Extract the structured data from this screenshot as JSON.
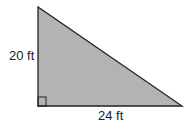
{
  "diagram": {
    "shape": "right-triangle",
    "fill_color": "#b3b3b3",
    "stroke_color": "#222222",
    "height_label": "20 ft",
    "base_label": "24 ft",
    "right_angle_marker": true
  }
}
